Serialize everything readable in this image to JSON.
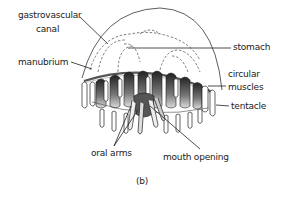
{
  "figure": {
    "caption": "(b)",
    "ink_color": "#222222",
    "labels": {
      "gastrovascular_line1": "gastrovascular",
      "gastrovascular_line2": "canal",
      "manubrium": "manubrium",
      "stomach": "stomach",
      "circular_line1": "circular",
      "circular_line2": "muscles",
      "tentacle": "tentacle",
      "oral_arms": "oral arms",
      "mouth_opening": "mouth opening"
    }
  }
}
